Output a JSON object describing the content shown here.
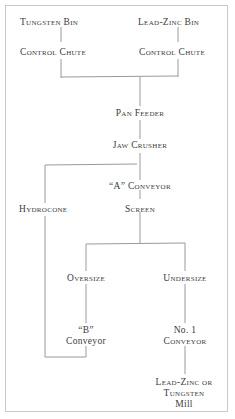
{
  "diagram": {
    "type": "flowchart",
    "nodes": {
      "tungsten_bin": "Tungsten Bin",
      "lead_zinc_bin": "Lead-Zinc Bin",
      "control_chute_left": "Control Chute",
      "control_chute_right": "Control Chute",
      "pan_feeder": "Pan Feeder",
      "jaw_crusher": "Jaw Crusher",
      "a_conveyor": "“A” Conveyor",
      "hydrocone": "Hydrocone",
      "screen": "Screen",
      "oversize": "Oversize",
      "undersize": "Undersize",
      "b_conveyor_line1": "“B”",
      "b_conveyor_line2": "Conveyor",
      "no1_conveyor_line1": "No. 1",
      "no1_conveyor_line2": "Conveyor",
      "mill_line1": "Lead-Zinc or",
      "mill_line2": "Tungsten",
      "mill_line3": "Mill"
    },
    "edges": [
      [
        "Tungsten Bin",
        "Control Chute (left)"
      ],
      [
        "Lead-Zinc Bin",
        "Control Chute (right)"
      ],
      [
        "Control Chute (left)",
        "Pan Feeder"
      ],
      [
        "Control Chute (right)",
        "Pan Feeder"
      ],
      [
        "Pan Feeder",
        "Jaw Crusher"
      ],
      [
        "Jaw Crusher",
        "\"A\" Conveyor"
      ],
      [
        "\"A\" Conveyor",
        "Screen"
      ],
      [
        "Jaw Crusher",
        "Hydrocone"
      ],
      [
        "Screen",
        "Oversize"
      ],
      [
        "Screen",
        "Undersize"
      ],
      [
        "Oversize",
        "\"B\" Conveyor"
      ],
      [
        "\"B\" Conveyor",
        "Hydrocone"
      ],
      [
        "Undersize",
        "No. 1 Conveyor"
      ],
      [
        "No. 1 Conveyor",
        "Lead-Zinc or Tungsten Mill"
      ]
    ]
  }
}
